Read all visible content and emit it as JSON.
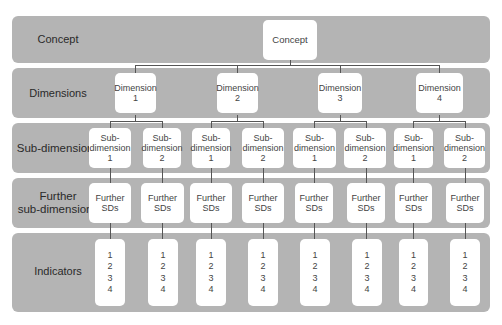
{
  "bands": {
    "concept": "Concept",
    "dimensions": "Dimensions",
    "subdimensions": "Sub-dimensions",
    "further_line1": "Further",
    "further_line2": "sub-dimensions",
    "indicators": "Indicators"
  },
  "concept_box": "Concept",
  "dimensions": [
    {
      "l1": "Dimension",
      "l2": "1"
    },
    {
      "l1": "Dimension",
      "l2": "2"
    },
    {
      "l1": "Dimension",
      "l2": "3"
    },
    {
      "l1": "Dimension",
      "l2": "4"
    }
  ],
  "subdimensions": [
    {
      "l1": "Sub-",
      "l2": "dimension",
      "l3": "1"
    },
    {
      "l1": "Sub-",
      "l2": "dimension",
      "l3": "2"
    },
    {
      "l1": "Sub-",
      "l2": "dimension",
      "l3": "1"
    },
    {
      "l1": "Sub-",
      "l2": "dimension",
      "l3": "2"
    },
    {
      "l1": "Sub-",
      "l2": "dimension",
      "l3": "1"
    },
    {
      "l1": "Sub-",
      "l2": "dimension",
      "l3": "2"
    },
    {
      "l1": "Sub-",
      "l2": "dimension",
      "l3": "1"
    },
    {
      "l1": "Sub-",
      "l2": "dimension",
      "l3": "2"
    }
  ],
  "further": [
    {
      "l1": "Further",
      "l2": "SDs"
    },
    {
      "l1": "Further",
      "l2": "SDs"
    },
    {
      "l1": "Further",
      "l2": "SDs"
    },
    {
      "l1": "Further",
      "l2": "SDs"
    },
    {
      "l1": "Further",
      "l2": "SDs"
    },
    {
      "l1": "Further",
      "l2": "SDs"
    },
    {
      "l1": "Further",
      "l2": "SDs"
    },
    {
      "l1": "Further",
      "l2": "SDs"
    }
  ],
  "indicators": [
    [
      "1",
      "2",
      "3",
      "4"
    ],
    [
      "1",
      "2",
      "3",
      "4"
    ],
    [
      "1",
      "2",
      "3",
      "4"
    ],
    [
      "1",
      "2",
      "3",
      "4"
    ],
    [
      "1",
      "2",
      "3",
      "4"
    ],
    [
      "1",
      "2",
      "3",
      "4"
    ],
    [
      "1",
      "2",
      "3",
      "4"
    ],
    [
      "1",
      "2",
      "3",
      "4"
    ]
  ]
}
